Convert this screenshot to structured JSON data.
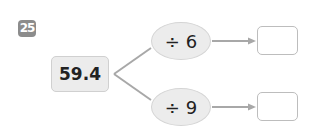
{
  "problem": {
    "number": "25",
    "start_value": "59.4",
    "operations": [
      {
        "label": "÷ 6",
        "answer": ""
      },
      {
        "label": "÷ 9",
        "answer": ""
      }
    ]
  },
  "colors": {
    "badge": "#8c8c8c",
    "box_fill": "#ececec",
    "line": "#a8a8a8",
    "answer_border": "#bdbdbd"
  }
}
